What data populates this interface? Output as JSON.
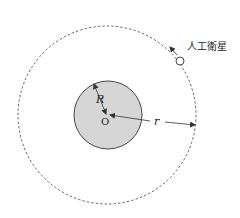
{
  "diagram": {
    "satellite_label": "人工衛星",
    "earth_radius_label": "R",
    "orbit_radius_label": "r",
    "center_label": "O",
    "colors": {
      "earth_fill": "#d6d6d6",
      "stroke": "#333333",
      "background": "#ffffff"
    }
  }
}
